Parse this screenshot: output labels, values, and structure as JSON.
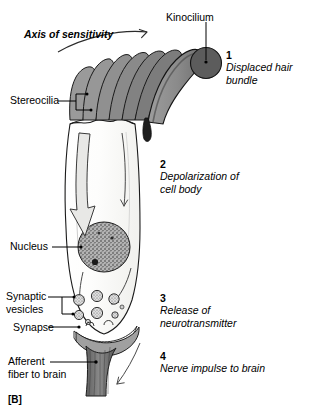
{
  "figure": {
    "panel_tag": "[B]",
    "axis_label": "Axis of sensitivity"
  },
  "labels": {
    "kinocilium": "Kinocilium",
    "stereocilia": "Stereocilia",
    "nucleus": "Nucleus",
    "synaptic_vesicles": "Synaptic\nvesicles",
    "synapse": "Synapse",
    "afferent_fiber": "Afferent\nfiber to brain"
  },
  "steps": [
    {
      "number": "1",
      "text": "Displaced hair bundle"
    },
    {
      "number": "2",
      "text": "Depolarization of\ncell body"
    },
    {
      "number": "3",
      "text": "Release of\nneurotransmitter"
    },
    {
      "number": "4",
      "text": "Nerve impulse to brain"
    }
  ],
  "colors": {
    "stroke": "#1a1a1a",
    "stereocilia_fill": "#8e8e8e",
    "kinocilium_fill": "#6d6d6d",
    "kinocilium_bulb": "#585858",
    "cell_fill": "#fbfbf9",
    "cell_inner_shade": "#eeeeec",
    "nucleus_fill": "#9a9a9a",
    "afferent_fill": "#7d7d7d",
    "synapse_fill": "#9c9c9c",
    "vesicle_fill": "#d8d8d8",
    "text": "#000000",
    "background": "#ffffff"
  },
  "anatomy": {
    "stereocilia_count": 6,
    "vesicle_count": 8
  }
}
